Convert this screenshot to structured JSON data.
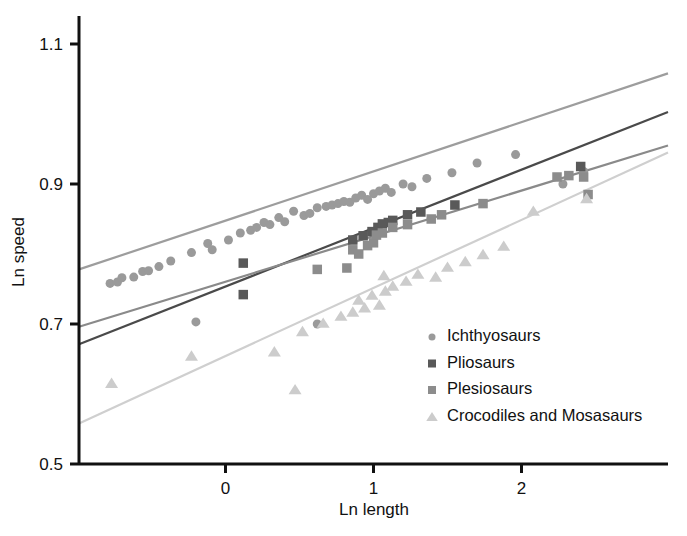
{
  "chart_data": {
    "type": "scatter",
    "title": "",
    "xlabel": "Ln length",
    "ylabel": "Ln speed",
    "xlim": [
      -0.99,
      2.99
    ],
    "ylim": [
      0.5,
      1.14
    ],
    "xticks": [
      0,
      1,
      2
    ],
    "xtick_labels": [
      "0",
      "1",
      "2"
    ],
    "yticks": [
      0.5,
      0.7,
      0.9,
      1.1
    ],
    "ytick_labels": [
      "0.5",
      "0.7",
      "0.9",
      "1.1"
    ],
    "grid": false,
    "legend_position": "bottom-right",
    "series": [
      {
        "name": "Ichthyosaurs",
        "marker": "circle",
        "color": "#9a9a9a",
        "line_color": "#9d9d9d",
        "trendline": {
          "x0": -0.99,
          "y0": 0.778,
          "x1": 2.99,
          "y1": 1.058
        },
        "points": [
          [
            -0.78,
            0.758
          ],
          [
            -0.73,
            0.76
          ],
          [
            -0.7,
            0.766
          ],
          [
            -0.62,
            0.767
          ],
          [
            -0.56,
            0.775
          ],
          [
            -0.52,
            0.776
          ],
          [
            -0.45,
            0.782
          ],
          [
            -0.37,
            0.79
          ],
          [
            -0.23,
            0.802
          ],
          [
            -0.12,
            0.815
          ],
          [
            -0.09,
            0.806
          ],
          [
            0.02,
            0.82
          ],
          [
            0.1,
            0.83
          ],
          [
            0.17,
            0.834
          ],
          [
            0.21,
            0.838
          ],
          [
            0.26,
            0.845
          ],
          [
            0.3,
            0.842
          ],
          [
            0.36,
            0.852
          ],
          [
            0.4,
            0.846
          ],
          [
            0.46,
            0.861
          ],
          [
            0.53,
            0.855
          ],
          [
            0.57,
            0.858
          ],
          [
            0.62,
            0.866
          ],
          [
            0.68,
            0.868
          ],
          [
            0.72,
            0.87
          ],
          [
            0.76,
            0.872
          ],
          [
            0.8,
            0.875
          ],
          [
            0.84,
            0.874
          ],
          [
            0.88,
            0.88
          ],
          [
            0.92,
            0.884
          ],
          [
            0.96,
            0.878
          ],
          [
            1.0,
            0.886
          ],
          [
            1.04,
            0.89
          ],
          [
            1.08,
            0.894
          ],
          [
            1.12,
            0.888
          ],
          [
            1.2,
            0.9
          ],
          [
            1.26,
            0.896
          ],
          [
            1.36,
            0.908
          ],
          [
            1.53,
            0.916
          ],
          [
            1.7,
            0.93
          ],
          [
            1.96,
            0.942
          ],
          [
            2.28,
            0.9
          ],
          [
            2.42,
            0.918
          ],
          [
            -0.2,
            0.703
          ],
          [
            0.62,
            0.7
          ]
        ]
      },
      {
        "name": "Pliosaurs",
        "marker": "square",
        "color": "#595959",
        "line_color": "#4a4a4a",
        "trendline": {
          "x0": -0.99,
          "y0": 0.671,
          "x1": 2.99,
          "y1": 1.003
        },
        "points": [
          [
            0.12,
            0.742
          ],
          [
            0.12,
            0.787
          ],
          [
            0.86,
            0.82
          ],
          [
            0.93,
            0.826
          ],
          [
            0.99,
            0.832
          ],
          [
            1.03,
            0.838
          ],
          [
            1.06,
            0.843
          ],
          [
            1.1,
            0.845
          ],
          [
            1.13,
            0.848
          ],
          [
            1.23,
            0.856
          ],
          [
            1.32,
            0.86
          ],
          [
            1.55,
            0.87
          ],
          [
            2.4,
            0.925
          ]
        ]
      },
      {
        "name": "Plesiosaurs",
        "marker": "square",
        "color": "#8c8c8c",
        "line_color": "#8a8a8a",
        "trendline": {
          "x0": -0.99,
          "y0": 0.696,
          "x1": 2.99,
          "y1": 0.955
        },
        "points": [
          [
            0.86,
            0.806
          ],
          [
            0.9,
            0.8
          ],
          [
            0.96,
            0.812
          ],
          [
            1.0,
            0.816
          ],
          [
            1.02,
            0.827
          ],
          [
            1.06,
            0.83
          ],
          [
            1.13,
            0.838
          ],
          [
            1.23,
            0.842
          ],
          [
            1.39,
            0.85
          ],
          [
            1.46,
            0.856
          ],
          [
            0.62,
            0.778
          ],
          [
            0.82,
            0.78
          ],
          [
            2.24,
            0.91
          ],
          [
            2.32,
            0.912
          ],
          [
            2.42,
            0.91
          ],
          [
            2.45,
            0.885
          ],
          [
            1.74,
            0.872
          ]
        ]
      },
      {
        "name": "Crocodiles and Mosasaurs",
        "marker": "triangle",
        "color": "#cccccc",
        "line_color": "#cfcfcf",
        "trendline": {
          "x0": -0.99,
          "y0": 0.558,
          "x1": 2.99,
          "y1": 0.945
        },
        "points": [
          [
            -0.77,
            0.616
          ],
          [
            -0.23,
            0.655
          ],
          [
            0.33,
            0.661
          ],
          [
            0.47,
            0.607
          ],
          [
            0.52,
            0.69
          ],
          [
            0.66,
            0.702
          ],
          [
            0.78,
            0.712
          ],
          [
            0.86,
            0.718
          ],
          [
            0.9,
            0.735
          ],
          [
            0.94,
            0.724
          ],
          [
            0.99,
            0.742
          ],
          [
            1.04,
            0.728
          ],
          [
            1.08,
            0.748
          ],
          [
            1.13,
            0.755
          ],
          [
            1.22,
            0.762
          ],
          [
            1.3,
            0.772
          ],
          [
            1.42,
            0.768
          ],
          [
            1.5,
            0.782
          ],
          [
            1.62,
            0.79
          ],
          [
            1.74,
            0.8
          ],
          [
            1.88,
            0.812
          ],
          [
            2.08,
            0.862
          ],
          [
            2.44,
            0.88
          ],
          [
            1.07,
            0.77
          ]
        ]
      }
    ]
  },
  "legend": {
    "entries": [
      {
        "label": "Ichthyosaurs",
        "marker": "circle",
        "color": "#9a9a9a"
      },
      {
        "label": "Pliosaurs",
        "marker": "square",
        "color": "#595959"
      },
      {
        "label": "Plesiosaurs",
        "marker": "square",
        "color": "#8c8c8c"
      },
      {
        "label": "Crocodiles and Mosasaurs",
        "marker": "triangle",
        "color": "#cccccc"
      }
    ]
  },
  "axes": {
    "x_title": "Ln length",
    "y_title": "Ln speed",
    "axis_color": "#111111"
  }
}
